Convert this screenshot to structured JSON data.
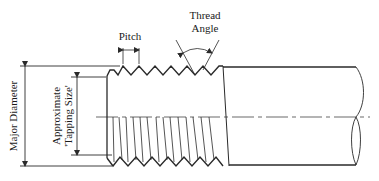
{
  "diagram": {
    "labels": {
      "pitch": "Pitch",
      "thread_angle_line1": "Thread",
      "thread_angle_line2": "Angle",
      "major_diameter": "Major Diameter",
      "tapping_line1": "Approximate",
      "tapping_line2": "'Tapping Size'"
    },
    "colors": {
      "stroke": "#2a2a2a",
      "text": "#1a1a1a",
      "background": "#ffffff"
    }
  }
}
